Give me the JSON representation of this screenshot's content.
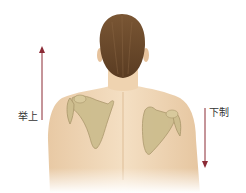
{
  "figure": {
    "labels": {
      "elevation": "举上",
      "depression": "下制"
    },
    "arrows": {
      "elevation": {
        "direction": "up",
        "color": "#8b2a35"
      },
      "depression": {
        "direction": "down",
        "color": "#8b2a35"
      }
    },
    "colors": {
      "skin": "#f1d9b9",
      "skin_shadow": "#e3c39d",
      "hair": "#6b4a2e",
      "bone": "#c9b98a",
      "bone_edge": "#a8956a"
    }
  }
}
